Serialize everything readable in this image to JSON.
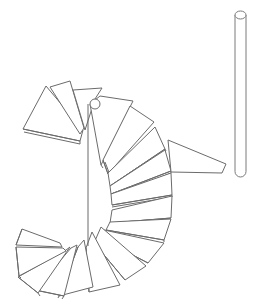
{
  "drawing": {
    "subject": "spiral staircase line drawing",
    "stroke_color": "#6b6b6b",
    "background": "#ffffff",
    "center_column": {
      "x": 88,
      "y1": 104,
      "y2": 246
    },
    "top_hole": {
      "cx": 95,
      "cy": 104,
      "r": 5
    },
    "pole": {
      "x": 235,
      "width": 11,
      "top": 15,
      "bottom": 177
    },
    "landing": {
      "points": "168,140 226,164 222,173 171,172"
    },
    "steps": [
      {
        "points": "23,129 46,86 83,130 80,141",
        "thick": "23,129 80,141 80,144 24,132"
      },
      {
        "points": "50,87 70,81 84,128 80,134",
        "thick": ""
      },
      {
        "points": "73,90 102,88 95,99 85,130",
        "thick": ""
      },
      {
        "points": "90,104 100,96 133,101 101,165",
        "thick": "101,165 103,168"
      },
      {
        "points": "103,160 130,106 154,122 108,174",
        "thick": "103,160 108,174 110,175 105,162"
      },
      {
        "points": "108,173 155,127 165,149 110,186",
        "thick": "110,186 165,149 166,151 111,188"
      },
      {
        "points": "110,186 165,150 171,171 111,194",
        "thick": "111,194 171,171 171,173 112,196"
      },
      {
        "points": "111,194 171,173 172,195 112,205",
        "thick": "112,205 172,195 172,197 112,207"
      },
      {
        "points": "112,210 172,196 171,218 110,223",
        "thick": "110,223 171,218"
      },
      {
        "points": "110,222 171,219 164,240 106,230",
        "thick": "106,230 164,240 164,242"
      },
      {
        "points": "104,230 164,243 148,263 100,238",
        "thick": "100,238 148,263"
      },
      {
        "points": "101,227 146,266 125,280 94,243",
        "thick": "94,243 125,280"
      },
      {
        "points": "92,232 120,285 89,292 86,248",
        "thick": "86,248 89,292"
      },
      {
        "points": "84,240 93,287 59,296 78,247",
        "thick": "78,247 59,296 58,298"
      },
      {
        "points": "77,245 64,296 35,290 71,248",
        "thick": "35,290 64,296 62,299"
      },
      {
        "points": "70,247 38,293 18,277 66,250",
        "thick": "18,277 38,293 40,296"
      },
      {
        "points": "66,251 19,276 16,247 63,248",
        "thick": "16,247 19,276 21,278"
      },
      {
        "points": "62,247 16,245 22,229 60,243",
        "thick": "16,245 22,229"
      }
    ]
  }
}
